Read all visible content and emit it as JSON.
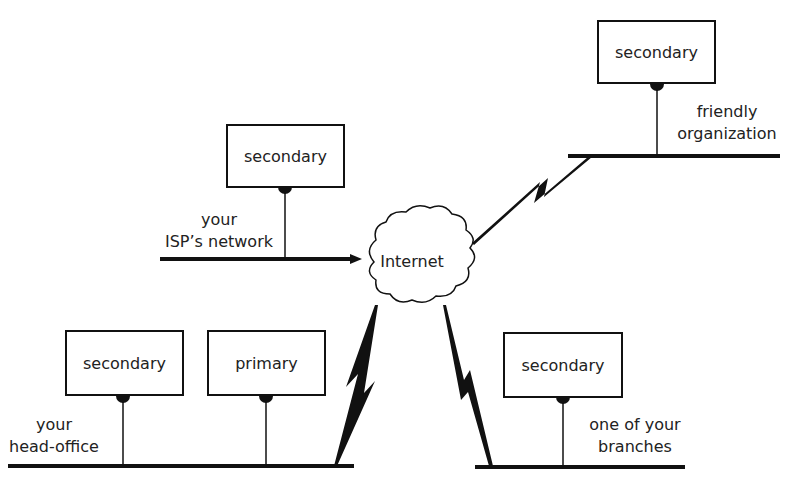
{
  "diagram": {
    "cloud": {
      "label": "Internet"
    },
    "servers": [
      {
        "id": "friendly",
        "role": "secondary"
      },
      {
        "id": "isp",
        "role": "secondary"
      },
      {
        "id": "headoffice-secondary",
        "role": "secondary"
      },
      {
        "id": "headoffice-primary",
        "role": "primary"
      },
      {
        "id": "branch",
        "role": "secondary"
      }
    ],
    "networks": {
      "friendly": {
        "line1": "friendly",
        "line2": "organization"
      },
      "isp": {
        "line1": "your",
        "line2": "ISP’s network"
      },
      "headoffice": {
        "line1": "your",
        "line2": "head-office"
      },
      "branch": {
        "line1": "one of your",
        "line2": "branches"
      }
    },
    "colors": {
      "stroke": "#111111",
      "background": "#ffffff"
    }
  }
}
